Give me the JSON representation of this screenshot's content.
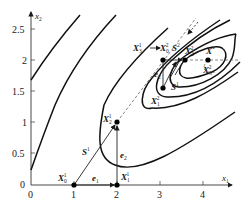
{
  "figure": {
    "type": "optimization-contour-diagram"
  },
  "axes": {
    "x_label": "x",
    "x_label_sub": "1",
    "y_label": "x",
    "y_label_sub": "2",
    "x_ticks": [
      "0",
      "1",
      "2",
      "3",
      "4"
    ],
    "y_ticks": [
      "0",
      "0.5",
      "1",
      "1.5",
      "2",
      "2.5"
    ],
    "origin_label": "0"
  },
  "points": [
    {
      "id": "X0_1",
      "label": "X",
      "sub": "0",
      "sup": "1",
      "x": 1,
      "y": 0
    },
    {
      "id": "X1_1",
      "label": "X",
      "sub": "1",
      "sup": "1",
      "x": 2,
      "y": 0
    },
    {
      "id": "X2_1",
      "label": "X",
      "sub": "2",
      "sup": "1",
      "x": 2,
      "y": 1
    },
    {
      "id": "X0_2",
      "label": "X",
      "sub": "0",
      "sup": "2",
      "x": 3,
      "y": 2
    },
    {
      "id": "X1_2",
      "label": "X",
      "sub": "1",
      "sup": "2",
      "x": 3,
      "y": 1.55
    },
    {
      "id": "X2_2",
      "label": "X",
      "sub": "2",
      "sup": "2",
      "x": 3.5,
      "y": 2
    },
    {
      "id": "Xstar",
      "label": "X",
      "sup": "*",
      "x": 4.05,
      "y": 2
    },
    {
      "id": "X3_2",
      "label": "X",
      "sub": "3",
      "sup": "2"
    }
  ],
  "vectors": [
    {
      "label": "e",
      "sub": "1"
    },
    {
      "label": "e",
      "sub": "2"
    },
    {
      "label": "e",
      "sub": "2",
      "near": "second-stage"
    },
    {
      "label": "S",
      "sup": "1"
    },
    {
      "label": "S",
      "sup": "1",
      "near": "second-stage"
    },
    {
      "label": "S",
      "sup": "2"
    }
  ],
  "annotations": {
    "arrow_text_left": "X",
    "arrow_text_left_sub": "3",
    "arrow_text_left_sup": "1",
    "arrow_text_right": "X",
    "arrow_text_right_sub": "0",
    "arrow_text_right_sup": "2"
  }
}
